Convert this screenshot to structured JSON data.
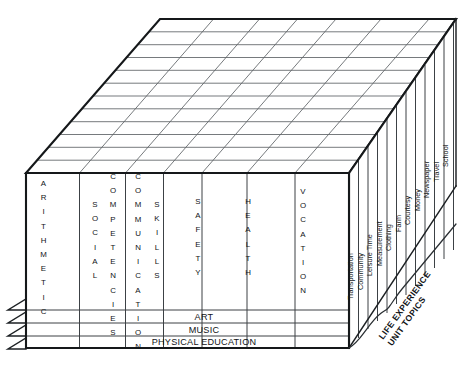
{
  "figure": {
    "side_caption_line1": "LIFE EXPERIENCE",
    "side_caption_line2": "UNIT TOPICS"
  },
  "front_face": {
    "columns": [
      {
        "id": "arithmetic",
        "labels": [
          "ARITHMETIC"
        ]
      },
      {
        "id": "social-competencies",
        "labels": [
          "SOCIAL",
          "COMPETENCIES"
        ]
      },
      {
        "id": "communication-skills",
        "labels": [
          "COMMUNICATION",
          "SKILLS"
        ]
      },
      {
        "id": "safety",
        "labels": [
          "SAFETY"
        ]
      },
      {
        "id": "health",
        "labels": [
          "HEALTH"
        ]
      },
      {
        "id": "vocation",
        "labels": [
          "VOCATION"
        ]
      }
    ],
    "bottom_bands": [
      {
        "id": "art",
        "label": "ART"
      },
      {
        "id": "music",
        "label": "MUSIC"
      },
      {
        "id": "physical-education",
        "label": "PHYSICAL EDUCATION"
      }
    ]
  },
  "side_face": {
    "topics": [
      "Transportation",
      "Community",
      "Leisure Time",
      "Measurement",
      "Clothing",
      "Farm",
      "Courtesy",
      "Money",
      "Newspaper",
      "Travel",
      "School"
    ]
  },
  "top_face": {
    "row_count": 12,
    "column_count": 7
  },
  "colors": {
    "background": "#ffffff",
    "heavy_edge": "#15181a",
    "grid_line": "#5d6266",
    "text": "#111417"
  }
}
